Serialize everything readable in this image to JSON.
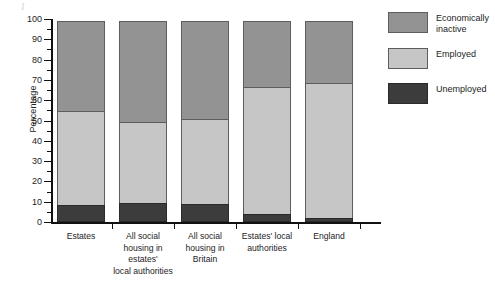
{
  "chart_data": {
    "type": "bar",
    "subtype": "stacked-bar-100",
    "title": "",
    "xlabel": "",
    "ylabel": "Percentage",
    "ylim": [
      0,
      100
    ],
    "ytick_step": 10,
    "yminor_step": 5,
    "grid": false,
    "legend_position": "right",
    "categories": [
      "Estates",
      "All social housing in estates' local authorities",
      "All social housing in Britain",
      "Estates' local authorities",
      "England"
    ],
    "category_label_lines": [
      [
        "Estates"
      ],
      [
        "All social",
        "housing in",
        "estates'",
        "local authorities"
      ],
      [
        "All social",
        "housing in",
        "Britain"
      ],
      [
        "Estates' local",
        "authorities"
      ],
      [
        "England"
      ]
    ],
    "ytick_labels": [
      "0",
      "10",
      "20",
      "30",
      "40",
      "50",
      "60",
      "70",
      "80",
      "90",
      "100"
    ],
    "ytick_values": [
      0,
      10,
      20,
      30,
      40,
      50,
      60,
      70,
      80,
      90,
      100
    ],
    "series": [
      {
        "name": "Unemployed",
        "color": "#3c3c3c",
        "values": [
          8.5,
          9.5,
          9,
          4,
          2
        ]
      },
      {
        "name": "Employed",
        "color": "#c6c6c6",
        "values": [
          46.5,
          40.5,
          42,
          63,
          67
        ]
      },
      {
        "name": "Economically inactive",
        "color": "#939393",
        "values": [
          45,
          50,
          49,
          33,
          31
        ]
      }
    ],
    "cumulative_tops": {
      "unemployed": [
        8.5,
        9.5,
        9,
        4,
        2
      ],
      "employed": [
        55,
        50,
        51,
        67,
        69
      ],
      "inactive": [
        100,
        100,
        100,
        100,
        100
      ]
    }
  },
  "legend": {
    "items": [
      {
        "label": "Economically inactive",
        "color": "#939393",
        "swatch_name": "economically-inactive"
      },
      {
        "label": "Employed",
        "color": "#c6c6c6",
        "swatch_name": "employed"
      },
      {
        "label": "Unemployed",
        "color": "#3c3c3c",
        "swatch_name": "unemployed"
      }
    ]
  },
  "artifact": {
    "mark": "ʃ"
  }
}
